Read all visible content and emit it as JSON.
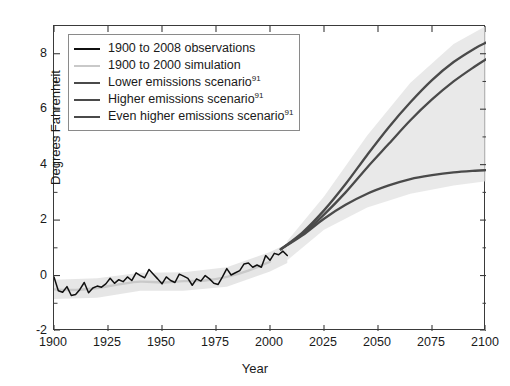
{
  "chart_data": {
    "type": "line",
    "title": "",
    "xlabel": "Year",
    "ylabel": "Degrees Fahrenheit",
    "xlim": [
      1900,
      2100
    ],
    "ylim": [
      -2,
      9
    ],
    "xticks": [
      1900,
      1925,
      1950,
      1975,
      2000,
      2025,
      2050,
      2075,
      2100
    ],
    "yticks": [
      -2,
      0,
      2,
      4,
      6,
      8
    ],
    "yminorticks": [
      -1,
      1,
      3,
      5,
      7
    ],
    "grid": false,
    "legend_position": "upper left",
    "colors": {
      "observations": "#101010",
      "simulation": "#c9c9c9",
      "lower": "#4a4a4a",
      "higher": "#4a4a4a",
      "even_higher": "#4a4a4a",
      "uncertainty_band": "#e2e2e2",
      "axis": "#3a3a3a"
    },
    "series": [
      {
        "name": "1900 to 2008 observations",
        "color": "#101010",
        "x": [
          1900,
          1902,
          1904,
          1906,
          1908,
          1910,
          1912,
          1914,
          1916,
          1918,
          1920,
          1922,
          1924,
          1926,
          1928,
          1930,
          1932,
          1934,
          1936,
          1938,
          1940,
          1942,
          1944,
          1946,
          1948,
          1950,
          1952,
          1954,
          1956,
          1958,
          1960,
          1962,
          1964,
          1966,
          1968,
          1970,
          1972,
          1974,
          1976,
          1978,
          1980,
          1982,
          1984,
          1986,
          1988,
          1990,
          1992,
          1994,
          1996,
          1998,
          2000,
          2002,
          2004,
          2006,
          2008
        ],
        "values": [
          -0.05,
          -0.55,
          -0.6,
          -0.4,
          -0.72,
          -0.68,
          -0.5,
          -0.25,
          -0.62,
          -0.45,
          -0.38,
          -0.42,
          -0.3,
          -0.1,
          -0.28,
          -0.15,
          -0.22,
          -0.05,
          -0.18,
          0.1,
          0.0,
          -0.08,
          0.22,
          0.05,
          -0.12,
          -0.3,
          -0.05,
          -0.18,
          -0.25,
          0.05,
          -0.02,
          -0.1,
          -0.35,
          -0.12,
          -0.2,
          0.0,
          -0.12,
          -0.28,
          -0.32,
          -0.05,
          0.25,
          0.02,
          0.1,
          0.18,
          0.42,
          0.45,
          0.3,
          0.38,
          0.3,
          0.72,
          0.55,
          0.8,
          0.75,
          0.88,
          0.72
        ]
      },
      {
        "name": "1900 to 2000 simulation",
        "color": "#c9c9c9",
        "x": [
          1900,
          1910,
          1920,
          1930,
          1940,
          1950,
          1960,
          1970,
          1980,
          1990,
          2000
        ],
        "values": [
          -0.5,
          -0.52,
          -0.45,
          -0.32,
          -0.22,
          -0.25,
          -0.2,
          -0.18,
          -0.05,
          0.18,
          0.5
        ]
      },
      {
        "name": "Lower emissions scenario",
        "footnote": "91",
        "color": "#4a4a4a",
        "x": [
          2005,
          2015,
          2025,
          2035,
          2045,
          2055,
          2065,
          2075,
          2085,
          2095,
          2100
        ],
        "values": [
          0.95,
          1.45,
          2.05,
          2.55,
          2.95,
          3.25,
          3.48,
          3.62,
          3.72,
          3.78,
          3.8
        ]
      },
      {
        "name": "Higher emissions scenario",
        "footnote": "91",
        "color": "#4a4a4a",
        "x": [
          2005,
          2015,
          2025,
          2035,
          2045,
          2055,
          2065,
          2075,
          2085,
          2095,
          2100
        ],
        "values": [
          0.95,
          1.5,
          2.2,
          3.0,
          3.9,
          4.75,
          5.6,
          6.35,
          7.0,
          7.55,
          7.8
        ]
      },
      {
        "name": "Even higher emissions scenario",
        "footnote": "91",
        "color": "#4a4a4a",
        "x": [
          2005,
          2015,
          2025,
          2035,
          2045,
          2055,
          2065,
          2075,
          2085,
          2095,
          2100
        ],
        "values": [
          0.95,
          1.55,
          2.35,
          3.3,
          4.35,
          5.35,
          6.25,
          7.05,
          7.7,
          8.2,
          8.4
        ]
      }
    ],
    "uncertainty_bands": [
      {
        "name": "observed-simulation spread",
        "x": [
          1900,
          1920,
          1940,
          1960,
          1980,
          2000,
          2008
        ],
        "lower": [
          -0.85,
          -0.8,
          -0.55,
          -0.55,
          -0.4,
          0.15,
          0.45
        ],
        "upper": [
          -0.15,
          -0.1,
          0.1,
          0.12,
          0.3,
          0.85,
          1.15
        ]
      },
      {
        "name": "scenario spread",
        "x": [
          2008,
          2025,
          2045,
          2065,
          2085,
          2100
        ],
        "lower": [
          0.55,
          1.65,
          2.45,
          2.95,
          3.25,
          3.4
        ],
        "upper": [
          1.25,
          2.85,
          5.05,
          6.95,
          8.35,
          9.0
        ]
      }
    ]
  },
  "axes": {
    "ylabel": "Degrees Fahrenheit",
    "xlabel": "Year",
    "ytick_labels": [
      "8",
      "6",
      "4",
      "2",
      "0",
      "-2"
    ],
    "xtick_labels": [
      "1900",
      "1925",
      "1950",
      "1975",
      "2000",
      "2025",
      "2050",
      "2075",
      "2100"
    ]
  },
  "legend": {
    "items": [
      {
        "label": "1900 to 2008 observations",
        "footnote": "",
        "color": "#101010",
        "width": "2.6px"
      },
      {
        "label": "1900 to 2000 simulation",
        "footnote": "",
        "color": "#c9c9c9",
        "width": "2.2px"
      },
      {
        "label": "Lower emissions scenario",
        "footnote": "91",
        "color": "#4a4a4a",
        "width": "2.4px"
      },
      {
        "label": "Higher emissions scenario",
        "footnote": "91",
        "color": "#4a4a4a",
        "width": "2.4px"
      },
      {
        "label": "Even higher emissions scenario",
        "footnote": "91",
        "color": "#4a4a4a",
        "width": "2.4px"
      }
    ]
  }
}
